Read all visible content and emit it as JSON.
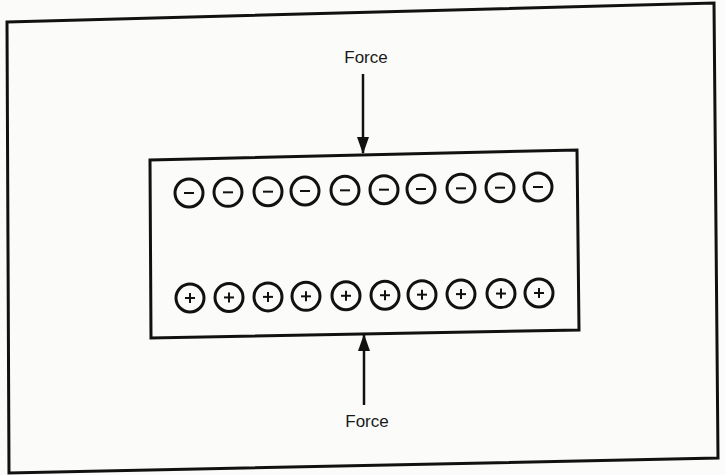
{
  "diagram": {
    "top_force_label": "Force",
    "bottom_force_label": "Force",
    "negative_charges": [
      "−",
      "−",
      "−",
      "−",
      "−",
      "−",
      "−",
      "−",
      "−",
      "−"
    ],
    "positive_charges": [
      "+",
      "+",
      "+",
      "+",
      "+",
      "+",
      "+",
      "+",
      "+",
      "+"
    ],
    "negative_charge_x": [
      189,
      228,
      268,
      305,
      345,
      384,
      421,
      461,
      500,
      538
    ],
    "positive_charge_x": [
      190,
      229,
      268,
      306,
      346,
      385,
      422,
      461,
      501,
      539
    ],
    "colors": {
      "ink": "#111111",
      "paper": "#fbfbfa"
    }
  }
}
